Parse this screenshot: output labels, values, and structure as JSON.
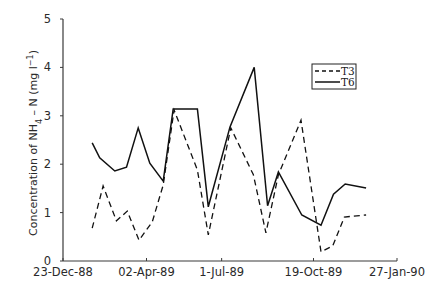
{
  "chart_data": {
    "type": "line",
    "title": "",
    "xlabel": "",
    "ylabel": "Concentration of NH4 – N (mg l-1)",
    "ylabel_parts": {
      "prefix": "Concentration of NH",
      "sub": "4",
      "middle": " – N (mg l",
      "sup": "−1",
      "suffix": ")"
    },
    "ylim": [
      0,
      5
    ],
    "yticks": [
      0,
      1,
      2,
      3,
      4,
      5
    ],
    "xlim_days": [
      0,
      400
    ],
    "xticks": [
      {
        "label": "23-Dec-88",
        "day": 0
      },
      {
        "label": "02-Apr-89",
        "day": 100
      },
      {
        "label": "1-Jul-89",
        "day": 190
      },
      {
        "label": "19-Oct-89",
        "day": 300
      },
      {
        "label": "27-Jan-90",
        "day": 400
      }
    ],
    "grid": false,
    "legend_position": "upper right",
    "series": [
      {
        "name": "T3",
        "style": "dashed",
        "points": [
          {
            "day": 35,
            "value": 0.68
          },
          {
            "day": 48,
            "value": 1.55
          },
          {
            "day": 64,
            "value": 0.83
          },
          {
            "day": 77,
            "value": 1.03
          },
          {
            "day": 91,
            "value": 0.43
          },
          {
            "day": 107,
            "value": 0.81
          },
          {
            "day": 120,
            "value": 1.57
          },
          {
            "day": 133,
            "value": 3.12
          },
          {
            "day": 161,
            "value": 1.88
          },
          {
            "day": 174,
            "value": 0.54
          },
          {
            "day": 201,
            "value": 2.75
          },
          {
            "day": 228,
            "value": 1.78
          },
          {
            "day": 243,
            "value": 0.58
          },
          {
            "day": 258,
            "value": 1.78
          },
          {
            "day": 285,
            "value": 2.91
          },
          {
            "day": 309,
            "value": 0.19
          },
          {
            "day": 323,
            "value": 0.31
          },
          {
            "day": 337,
            "value": 0.91
          },
          {
            "day": 363,
            "value": 0.95
          }
        ]
      },
      {
        "name": "T6",
        "style": "solid",
        "points": [
          {
            "day": 35,
            "value": 2.44
          },
          {
            "day": 44,
            "value": 2.13
          },
          {
            "day": 62,
            "value": 1.86
          },
          {
            "day": 76,
            "value": 1.94
          },
          {
            "day": 90,
            "value": 2.75
          },
          {
            "day": 104,
            "value": 2.02
          },
          {
            "day": 120,
            "value": 1.65
          },
          {
            "day": 132,
            "value": 3.14
          },
          {
            "day": 161,
            "value": 3.14
          },
          {
            "day": 174,
            "value": 1.12
          },
          {
            "day": 200,
            "value": 2.77
          },
          {
            "day": 229,
            "value": 4.0
          },
          {
            "day": 245,
            "value": 1.14
          },
          {
            "day": 258,
            "value": 1.84
          },
          {
            "day": 286,
            "value": 0.95
          },
          {
            "day": 309,
            "value": 0.74
          },
          {
            "day": 324,
            "value": 1.38
          },
          {
            "day": 338,
            "value": 1.59
          },
          {
            "day": 363,
            "value": 1.51
          }
        ]
      }
    ]
  },
  "legend": {
    "items": [
      {
        "label": "T3",
        "style": "dashed"
      },
      {
        "label": "T6",
        "style": "solid"
      }
    ]
  }
}
